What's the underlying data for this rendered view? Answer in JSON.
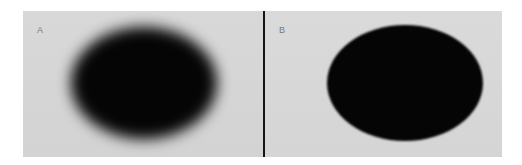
{
  "figure": {
    "panels": [
      {
        "label": "A",
        "description": "blurred black ellipse",
        "blur": "strong"
      },
      {
        "label": "B",
        "description": "sharp black ellipse",
        "blur": "slight"
      }
    ],
    "colors": {
      "background": "#d9d9d9",
      "ellipse": "#050505",
      "divider": "#141414",
      "label": "#7a7a7a"
    }
  }
}
